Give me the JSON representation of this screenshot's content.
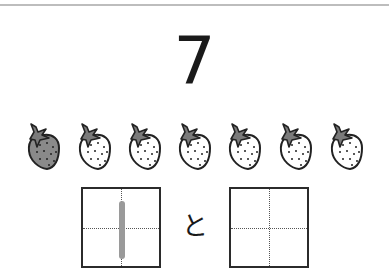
{
  "worksheet": {
    "number": "7",
    "connector": "と",
    "counters": {
      "icon": "strawberry-icon",
      "total": 7,
      "filled": 1,
      "items": [
        {
          "state": "filled"
        },
        {
          "state": "empty"
        },
        {
          "state": "empty"
        },
        {
          "state": "empty"
        },
        {
          "state": "empty"
        },
        {
          "state": "empty"
        },
        {
          "state": "empty"
        }
      ]
    },
    "answer_boxes": [
      {
        "position": "left",
        "guide_value": "1",
        "guide_glyph": "vertical-stroke"
      },
      {
        "position": "right",
        "guide_value": ""
      }
    ]
  },
  "colors": {
    "ink": "#1a1a1a",
    "filled_berry": "#8a8a8a",
    "leaf": "#7a7a7a",
    "guide_stroke": "#9a9a9a",
    "rule": "#bdbdbd"
  }
}
